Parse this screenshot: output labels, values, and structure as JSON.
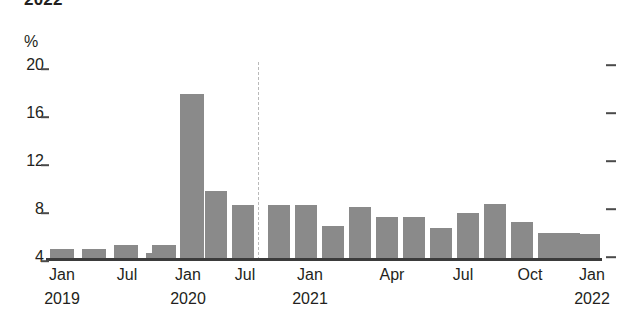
{
  "header": {
    "clipped_title": "2022",
    "unit_label": "%"
  },
  "axis": {
    "y_ticks": [
      "20",
      "16",
      "12",
      "8",
      "4"
    ],
    "x_labels": [
      {
        "text": "Jan",
        "year": "2019"
      },
      {
        "text": "Jul",
        "year": ""
      },
      {
        "text": "Jan",
        "year": "2020"
      },
      {
        "text": "Jul",
        "year": ""
      },
      {
        "text": "Jan",
        "year": "2021"
      },
      {
        "text": "Apr",
        "year": ""
      },
      {
        "text": "Jul",
        "year": ""
      },
      {
        "text": "Oct",
        "year": ""
      },
      {
        "text": "Jan",
        "year": "2022"
      }
    ]
  },
  "colors": {
    "bar": "#8a8a8a",
    "axis": "#3b3b3b",
    "divider": "#b9b9b9",
    "text": "#231f20"
  },
  "chart_data": {
    "type": "bar",
    "title": "",
    "xlabel": "",
    "ylabel": "%",
    "ylim": [
      4,
      20
    ],
    "grid": false,
    "legend": null,
    "y_ticks": [
      4,
      8,
      12,
      16,
      20
    ],
    "annotations": [
      {
        "type": "vertical-dashed-line",
        "at_category": "Jan 2021",
        "label": ""
      }
    ],
    "categories": [
      "Jan 2019",
      "Apr 2019",
      "Jul 2019",
      "Oct 2019",
      "Jan 2020",
      "Apr 2020",
      "Jul 2020",
      "Oct 2020",
      "Jan 2021",
      "Feb 2021",
      "Mar 2021",
      "Apr 2021",
      "May 2021",
      "Jun 2021",
      "Jul 2021",
      "Aug 2021",
      "Sep 2021",
      "Oct 2021",
      "Nov 2021",
      "Dec 2021",
      "Jan 2022",
      "Feb 2022"
    ],
    "values": [
      4.7,
      4.7,
      5.0,
      4.3,
      5.0,
      17.6,
      9.5,
      8.3,
      8.3,
      8.3,
      6.6,
      8.2,
      7.3,
      7.3,
      6.4,
      7.7,
      8.4,
      6.9,
      6.0,
      6.0,
      5.9,
      5.9
    ]
  },
  "bars": [
    {
      "name": "bar-jan-2019",
      "label": "Jan 2019",
      "value": 4.7,
      "x": 50,
      "w": 24
    },
    {
      "name": "bar-apr-2019",
      "label": "Apr 2019",
      "value": 4.7,
      "x": 82,
      "w": 24
    },
    {
      "name": "bar-jul-2019",
      "label": "Jul 2019",
      "value": 5.0,
      "x": 114,
      "w": 24
    },
    {
      "name": "bar-oct-2019",
      "label": "Oct 2019",
      "value": 4.3,
      "x": 146,
      "w": 24
    },
    {
      "name": "bar-jan-2020",
      "label": "Jan 2020",
      "value": 5.0,
      "x": 152,
      "w": 24
    },
    {
      "name": "bar-apr-2020",
      "label": "Apr 2020",
      "value": 17.6,
      "x": 180,
      "w": 24
    },
    {
      "name": "bar-jul-2020",
      "label": "Jul 2020",
      "value": 9.5,
      "x": 205,
      "w": 22
    },
    {
      "name": "bar-oct-2020",
      "label": "Oct 2020",
      "value": 8.3,
      "x": 232,
      "w": 22
    },
    {
      "name": "bar-jan-2021",
      "label": "Jan 2021",
      "value": 8.3,
      "x": 268,
      "w": 22
    },
    {
      "name": "bar-feb-2021",
      "label": "Feb 2021",
      "value": 8.3,
      "x": 295,
      "w": 22
    },
    {
      "name": "bar-mar-2021",
      "label": "Mar 2021",
      "value": 6.6,
      "x": 322,
      "w": 22
    },
    {
      "name": "bar-apr-2021",
      "label": "Apr 2021",
      "value": 8.2,
      "x": 349,
      "w": 22
    },
    {
      "name": "bar-may-2021",
      "label": "May 2021",
      "value": 7.3,
      "x": 376,
      "w": 22
    },
    {
      "name": "bar-jun-2021",
      "label": "Jun 2021",
      "value": 7.3,
      "x": 403,
      "w": 22
    },
    {
      "name": "bar-jul-2021",
      "label": "Jul 2021",
      "value": 6.4,
      "x": 430,
      "w": 22
    },
    {
      "name": "bar-aug-2021",
      "label": "Aug 2021",
      "value": 7.7,
      "x": 457,
      "w": 22
    },
    {
      "name": "bar-sep-2021",
      "label": "Sep 2021",
      "value": 8.4,
      "x": 484,
      "w": 22
    },
    {
      "name": "bar-oct-2021",
      "label": "Oct 2021",
      "value": 6.9,
      "x": 511,
      "w": 22
    },
    {
      "name": "bar-nov-2021",
      "label": "Nov 2021",
      "value": 6.0,
      "x": 538,
      "w": 22
    },
    {
      "name": "bar-dec-2021",
      "label": "Dec 2021",
      "value": 6.0,
      "x": 558,
      "w": 22
    },
    {
      "name": "bar-jan-2022",
      "label": "Jan 2022",
      "value": 5.9,
      "x": 578,
      "w": 22
    }
  ],
  "x_tick_positions": [
    {
      "month": "Jan",
      "year": "2019",
      "x": 62
    },
    {
      "month": "Jul",
      "year": "",
      "x": 127
    },
    {
      "month": "Jan",
      "year": "2020",
      "x": 188
    },
    {
      "month": "Jul",
      "year": "",
      "x": 245
    },
    {
      "month": "Jan",
      "year": "2021",
      "x": 310
    },
    {
      "month": "Apr",
      "year": "",
      "x": 392
    },
    {
      "month": "Jul",
      "year": "",
      "x": 463
    },
    {
      "month": "Oct",
      "year": "",
      "x": 530
    },
    {
      "month": "Jan",
      "year": "2022",
      "x": 592
    }
  ]
}
